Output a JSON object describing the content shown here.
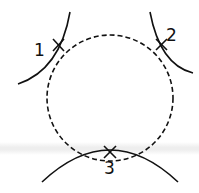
{
  "diagram": {
    "points": [
      {
        "label": "1",
        "x": 58,
        "y": 45
      },
      {
        "label": "2",
        "x": 162,
        "y": 44
      },
      {
        "label": "3",
        "x": 110,
        "y": 152
      }
    ],
    "circle": {
      "cx": 110,
      "cy": 98,
      "r": 64,
      "style": "dashed"
    },
    "stroke_color": "#111111"
  }
}
